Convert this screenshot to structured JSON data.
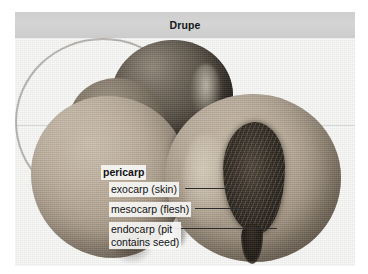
{
  "figure": {
    "title": "Drupe",
    "image_alt": "photograph-of-halved-peaches"
  },
  "labels": {
    "pericarp": "pericarp",
    "exocarp": "exocarp (skin)",
    "mesocarp": "mesocarp (flesh)",
    "endocarp_line1": "endocarp (pit",
    "endocarp_line2": "contains seed)"
  },
  "colors": {
    "title_band": "#d0d0d0",
    "title_text": "#15181c",
    "plate_background": "#f7f7f6",
    "label_background": "#f8f8f6",
    "label_text": "#101114",
    "leader_line": "#2a2a2a",
    "pit_dark": "#241e18",
    "flesh_light": "#c6b9a7"
  }
}
